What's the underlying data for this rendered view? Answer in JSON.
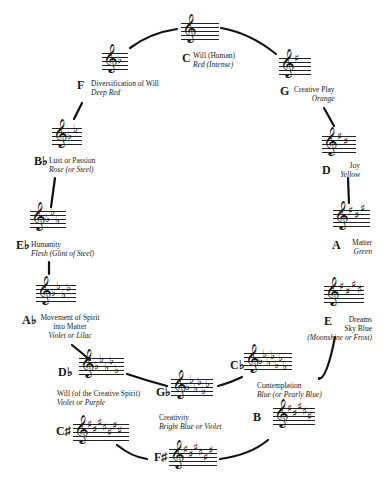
{
  "diagram": {
    "type": "circle-of-fifths",
    "nodes": [
      {
        "key": "C",
        "meaning": "Will (Human)",
        "color": "Red (Intense)",
        "accidentals": "",
        "count": 0
      },
      {
        "key": "G",
        "meaning": "Creative Play",
        "color": "Orange",
        "accidentals": "sharp",
        "count": 1
      },
      {
        "key": "D",
        "meaning": "Joy",
        "color": "Yellow",
        "accidentals": "sharp",
        "count": 2
      },
      {
        "key": "A",
        "meaning": "Matter",
        "color": "Green",
        "accidentals": "sharp",
        "count": 3
      },
      {
        "key": "E",
        "meaning": "Dreams",
        "meaning2": "Sky Blue",
        "color": "(Moonshine or Frost)",
        "accidentals": "sharp",
        "count": 4
      },
      {
        "key": "B",
        "meaning": "",
        "color": "",
        "accidentals": "sharp",
        "count": 5
      },
      {
        "key": "C♭",
        "meaning": "Contemplation",
        "color": "Blue (or Pearly Blue)",
        "accidentals": "flat",
        "count": 7
      },
      {
        "key": "F♯",
        "meaning": "",
        "color": "",
        "accidentals": "sharp",
        "count": 6
      },
      {
        "key": "G♭",
        "meaning": "Creativity",
        "color": "Bright Blue or Violet",
        "accidentals": "flat",
        "count": 6
      },
      {
        "key": "C♯",
        "meaning": "",
        "color": "",
        "accidentals": "sharp",
        "count": 7
      },
      {
        "key": "D♭",
        "meaning": "Will (of the Creative Spirit)",
        "color": "Violet or Purple",
        "accidentals": "flat",
        "count": 5
      },
      {
        "key": "A♭",
        "meaning": "Movement of Spirit",
        "meaning2": "into Matter",
        "color": "Violet or Lilac",
        "accidentals": "flat",
        "count": 4
      },
      {
        "key": "E♭",
        "meaning": "Humanity",
        "color": "Flesh (Glint of Steel)",
        "accidentals": "flat",
        "count": 3
      },
      {
        "key": "B♭",
        "meaning": "Lust or Passion",
        "color": "Rose (or Steel)",
        "accidentals": "flat",
        "count": 2
      },
      {
        "key": "F",
        "meaning": "Diversification of Will",
        "color": "Deep Red",
        "accidentals": "flat",
        "count": 1
      }
    ]
  },
  "glyphs": {
    "clef": "𝄞",
    "sharp": "♯",
    "flat": "♭"
  }
}
